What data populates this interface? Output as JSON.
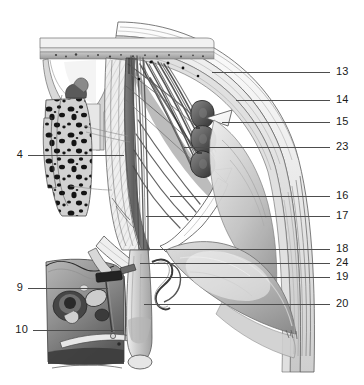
{
  "figure": {
    "style": "grayscale anatomical engraving",
    "background_color": "#ffffff",
    "ink_color": "#1a1a1a",
    "leader_color": "#4d4d4d"
  },
  "labels": {
    "left": [
      {
        "number": "4",
        "y": 155,
        "line_x1": 28,
        "line_x2": 124
      },
      {
        "number": "9",
        "y": 288,
        "line_x1": 28,
        "line_x2": 108
      },
      {
        "number": "10",
        "y": 330,
        "line_x1": 33,
        "line_x2": 124
      }
    ],
    "right": [
      {
        "number": "13",
        "y": 72,
        "line_x1": 212,
        "line_x2": 330
      },
      {
        "number": "14",
        "y": 100,
        "line_x1": 236,
        "line_x2": 330
      },
      {
        "number": "15",
        "y": 122,
        "line_x1": 222,
        "line_x2": 330
      },
      {
        "number": "23",
        "y": 147,
        "line_x1": 184,
        "line_x2": 330
      },
      {
        "number": "16",
        "y": 196,
        "line_x1": 170,
        "line_x2": 330
      },
      {
        "number": "17",
        "y": 216,
        "line_x1": 146,
        "line_x2": 330
      },
      {
        "number": "18",
        "y": 249,
        "line_x1": 140,
        "line_x2": 330
      },
      {
        "number": "24",
        "y": 263,
        "line_x1": 140,
        "line_x2": 330
      },
      {
        "number": "19",
        "y": 277,
        "line_x1": 140,
        "line_x2": 330
      },
      {
        "number": "20",
        "y": 304,
        "line_x1": 144,
        "line_x2": 330
      }
    ]
  }
}
